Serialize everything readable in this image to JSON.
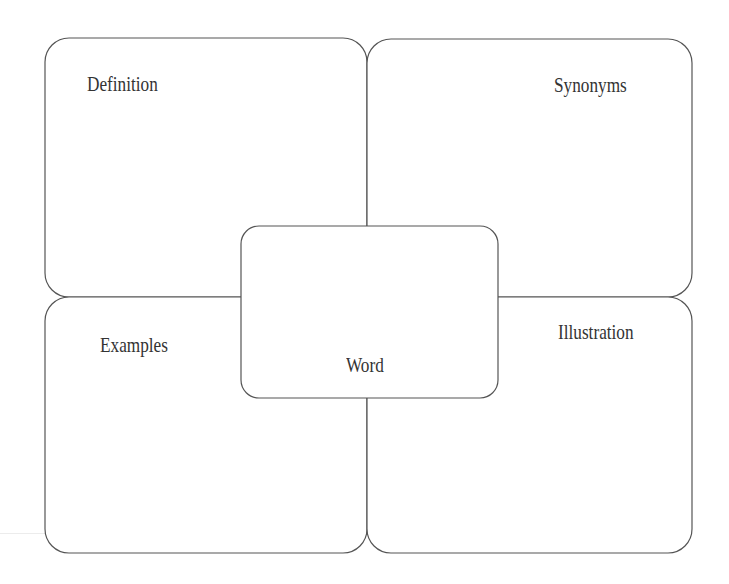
{
  "diagram": {
    "type": "frayer-model",
    "quadrants": {
      "top_left": {
        "label": "Definition"
      },
      "top_right": {
        "label": "Synonyms"
      },
      "bottom_left": {
        "label": "Examples"
      },
      "bottom_right": {
        "label": "Illustration"
      }
    },
    "center": {
      "label": "Word"
    },
    "colors": {
      "stroke": "#555555",
      "text": "#333333",
      "background": "#ffffff"
    }
  }
}
